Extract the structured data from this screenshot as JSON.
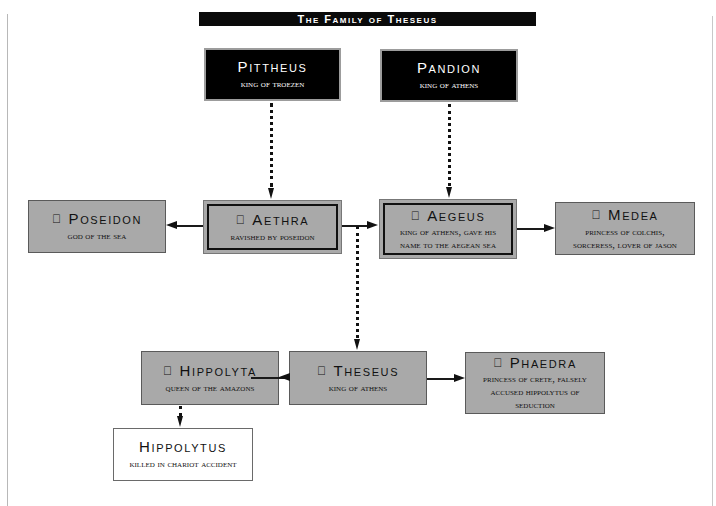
{
  "title": "The Family of Theseus",
  "nodes": {
    "pittheus": {
      "name": "Pittheus",
      "desc": [
        "King of Troezen"
      ],
      "style": "dark",
      "icon": ""
    },
    "pandion": {
      "name": "Pandion",
      "desc": [
        "King of Athens"
      ],
      "style": "dark",
      "icon": ""
    },
    "poseidon": {
      "name": "Poseidon",
      "desc": [
        "God of the sea"
      ],
      "style": "gray",
      "icon": "apple-icon"
    },
    "aethra": {
      "name": "Aethra",
      "desc": [
        "Ravished by Poseidon"
      ],
      "style": "gray-double",
      "icon": "apple-icon"
    },
    "aegeus": {
      "name": "Aegeus",
      "desc": [
        "King of Athens, gave his",
        "name to the Aegean sea"
      ],
      "style": "gray-double",
      "icon": "apple-icon"
    },
    "medea": {
      "name": "Medea",
      "desc": [
        "Princess of Colchis,",
        "sorceress, lover of Jason"
      ],
      "style": "gray",
      "icon": "apple-icon"
    },
    "hippolyta": {
      "name": "Hippolyta",
      "desc": [
        "Queen of the Amazons"
      ],
      "style": "gray",
      "icon": "apple-icon"
    },
    "theseus": {
      "name": "Theseus",
      "desc": [
        "King of Athens"
      ],
      "style": "gray",
      "icon": "apple-icon"
    },
    "phaedra": {
      "name": "Phaedra",
      "desc": [
        "Princess of Crete, falsely",
        "accused Hippolytus of",
        "seduction"
      ],
      "style": "gray",
      "icon": "apple-icon"
    },
    "hippolytus": {
      "name": "Hippolytus",
      "desc": [
        "Killed in chariot accident"
      ],
      "style": "white",
      "icon": ""
    }
  },
  "icon_glyph": "",
  "edges": [
    {
      "from": "pittheus",
      "to": "aethra",
      "type": "dotted"
    },
    {
      "from": "pandion",
      "to": "aegeus",
      "type": "dotted"
    },
    {
      "from": "aethra",
      "to": "poseidon",
      "type": "solid"
    },
    {
      "from": "aethra",
      "to": "aegeus",
      "type": "solid"
    },
    {
      "from": "aegeus",
      "to": "medea",
      "type": "solid"
    },
    {
      "from": "aethra",
      "to": "theseus",
      "type": "dotted"
    },
    {
      "from": "theseus",
      "to": "hippolyta",
      "type": "solid"
    },
    {
      "from": "theseus",
      "to": "phaedra",
      "type": "solid"
    },
    {
      "from": "hippolyta",
      "to": "hippolytus",
      "type": "dotted"
    }
  ],
  "colors": {
    "dark_box": "#000000",
    "gray_box": "#a9a9a9",
    "white_box": "#ffffff",
    "title_bar": "#0a0a0a"
  }
}
